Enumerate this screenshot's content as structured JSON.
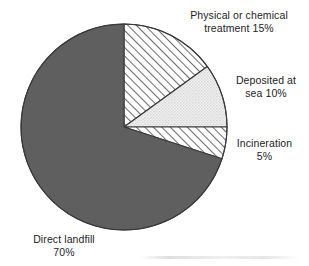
{
  "chart_data": {
    "type": "pie",
    "title": "",
    "subtitle": "",
    "xlabel": "",
    "ylabel": "",
    "legend_position": "callout-labels",
    "grid": false,
    "start_angle_deg": 0,
    "direction": "clockwise",
    "center": {
      "x": 124,
      "y": 127
    },
    "radius": 103,
    "categories": [
      "Physical or chemical treatment",
      "Deposited at sea",
      "Incineration",
      "Direct landfill"
    ],
    "values": [
      15,
      10,
      5,
      70
    ],
    "units": "%",
    "slices": [
      {
        "name": "Physical or chemical treatment",
        "value": 15,
        "value_label": "15%",
        "label_line1": "Physical or chemical",
        "label_line2": "treatment 15%",
        "label_text": "Physical or chemical\ntreatment 15%",
        "start_deg": 0,
        "end_deg": 54,
        "fill_style": "diagonal-hatch",
        "fill_color": "#ffffff",
        "line_color": "#6e6e6e",
        "stroke_color": "#3a3a3a"
      },
      {
        "name": "Deposited at sea",
        "value": 10,
        "value_label": "10%",
        "label_line1": "Deposited at",
        "label_line2": "sea 10%",
        "label_text": "Deposited at\nsea 10%",
        "start_deg": 54,
        "end_deg": 90,
        "fill_style": "light-stipple",
        "fill_color": "#ededed",
        "line_color": "#cfcfcf",
        "stroke_color": "#3a3a3a"
      },
      {
        "name": "Incineration",
        "value": 5,
        "value_label": "5%",
        "label_line1": "Incineration",
        "label_line2": "5%",
        "label_text": "Incineration\n5%",
        "start_deg": 90,
        "end_deg": 108,
        "fill_style": "diagonal-hatch",
        "fill_color": "#ffffff",
        "line_color": "#6e6e6e",
        "stroke_color": "#3a3a3a"
      },
      {
        "name": "Direct landfill",
        "value": 70,
        "value_label": "70%",
        "label_line1": "Direct landfill",
        "label_line2": "70%",
        "label_text": "Direct landfill\n70%",
        "start_deg": 108,
        "end_deg": 360,
        "fill_style": "solid",
        "fill_color": "#5f5f5f",
        "line_color": "#5f5f5f",
        "stroke_color": "#3a3a3a"
      }
    ],
    "colors": {
      "solid_dark_gray": "#5f5f5f",
      "stipple_light_gray": "#ededed",
      "hatch_white": "#ffffff",
      "outline": "#3a3a3a",
      "text": "#1d1d1d",
      "background": "#ffffff"
    }
  }
}
